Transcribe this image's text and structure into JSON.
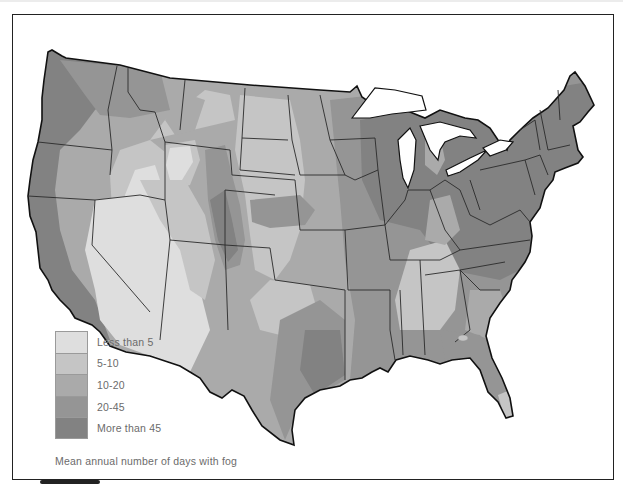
{
  "map": {
    "subject": "Contiguous United States",
    "caption": "Mean annual number of days with fog",
    "legend": [
      {
        "label": "Less than 5",
        "color": "#dedede"
      },
      {
        "label": "5-10",
        "color": "#c5c5c5"
      },
      {
        "label": "10-20",
        "color": "#aaaaaa"
      },
      {
        "label": "20-45",
        "color": "#959595"
      },
      {
        "label": "More than 45",
        "color": "#828282"
      }
    ],
    "colors": {
      "background": "#ffffff",
      "border": "#222222",
      "lakes": "#ffffff",
      "state_lines": "#2a2a2a"
    }
  }
}
